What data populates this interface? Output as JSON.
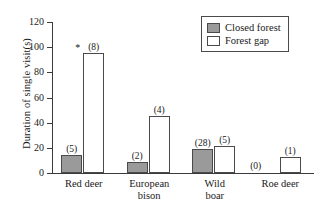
{
  "chart_data": {
    "type": "bar",
    "title": "",
    "xlabel": "",
    "ylabel": "Duration of single visit(s)",
    "ylim": [
      0,
      120
    ],
    "yticks": [
      "0",
      "20",
      "40",
      "60",
      "80",
      "100",
      "120"
    ],
    "grid": false,
    "legend_position": "top-right",
    "categories": [
      "Red deer",
      "European bison",
      "Wild boar",
      "Roe deer"
    ],
    "category_lines": [
      [
        "Red deer"
      ],
      [
        "European",
        "bison"
      ],
      [
        "Wild",
        "boar"
      ],
      [
        "Roe deer"
      ]
    ],
    "series": [
      {
        "name": "Closed forest",
        "color": "#9a9a9a",
        "values": [
          14,
          9,
          19,
          0
        ],
        "counts": [
          "(5)",
          "(2)",
          "(28)",
          "(0)"
        ],
        "significance": [
          "",
          "",
          "",
          ""
        ]
      },
      {
        "name": "Forest gap",
        "color": "#ffffff",
        "values": [
          95.5,
          45.5,
          21.5,
          12.5
        ],
        "counts": [
          "(8)",
          "(4)",
          "(5)",
          "(1)"
        ],
        "significance": [
          "*",
          "",
          "",
          ""
        ]
      }
    ],
    "annotations": [
      {
        "text": "*",
        "meaning": "significant-difference-marker",
        "category": "Red deer"
      }
    ]
  },
  "legend": {
    "items": [
      {
        "label": "Closed forest",
        "swatch": "closed"
      },
      {
        "label": "Forest gap",
        "swatch": "gap"
      }
    ]
  }
}
